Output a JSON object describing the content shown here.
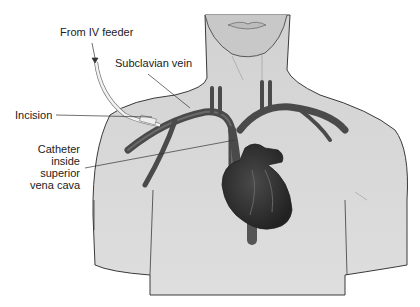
{
  "diagram": {
    "type": "anatomical-illustration",
    "colors": {
      "skin": "#d6d6d6",
      "outline": "#3a3a3a",
      "vessel": "#4a4a4a",
      "heart": "#333333",
      "catheter": "#eeeeee",
      "text": "#222222"
    },
    "labels": {
      "iv_feeder": "From IV feeder",
      "subclavian": "Subclavian vein",
      "incision": "Incision",
      "catheter_line1": "Catheter",
      "catheter_line2": "inside",
      "catheter_line3": "superior",
      "catheter_line4": "vena cava"
    }
  }
}
